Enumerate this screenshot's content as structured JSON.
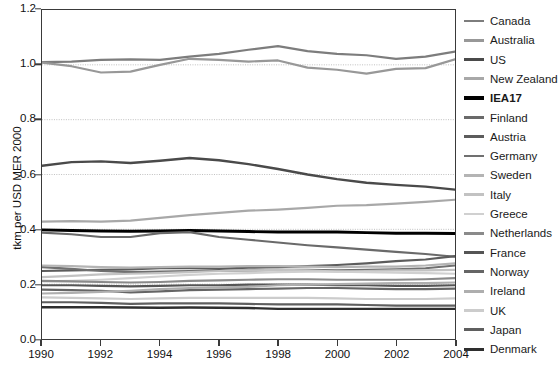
{
  "chart_data": {
    "type": "line",
    "title": "",
    "xlabel": "",
    "ylabel": "tkm per USD MER 2000",
    "xlim": [
      1990,
      2004
    ],
    "ylim": [
      0.0,
      1.2
    ],
    "x": [
      1990,
      1991,
      1992,
      1993,
      1994,
      1995,
      1996,
      1997,
      1998,
      1999,
      2000,
      2001,
      2002,
      2003,
      2004
    ],
    "ytick_labels": [
      "0.0",
      "0.2",
      "0.4",
      "0.6",
      "0.8",
      "1.0",
      "1.2"
    ],
    "ytick_values": [
      0.0,
      0.2,
      0.4,
      0.6,
      0.8,
      1.0,
      1.2
    ],
    "xtick_labels": [
      "1990",
      "1992",
      "1994",
      "1996",
      "1998",
      "2000",
      "2002",
      "2004"
    ],
    "xtick_values": [
      1990,
      1992,
      1994,
      1996,
      1998,
      2000,
      2002,
      2004
    ],
    "grid": "horizontal-dotted",
    "gridlines": [
      0.2,
      0.4,
      0.6,
      0.8,
      1.0
    ],
    "legend_position": "right",
    "series": [
      {
        "name": "Canada",
        "color": "#7d7d7d",
        "width": 2.2,
        "values": [
          1.01,
          1.012,
          1.018,
          1.02,
          1.018,
          1.03,
          1.04,
          1.055,
          1.068,
          1.05,
          1.04,
          1.035,
          1.022,
          1.03,
          1.048
        ]
      },
      {
        "name": "Australia",
        "color": "#989898",
        "width": 2.2,
        "values": [
          1.008,
          0.995,
          0.972,
          0.975,
          1.0,
          1.022,
          1.018,
          1.012,
          1.016,
          0.99,
          0.982,
          0.968,
          0.985,
          0.988,
          1.02
        ]
      },
      {
        "name": "US",
        "color": "#4a4a4a",
        "width": 2.4,
        "values": [
          0.632,
          0.645,
          0.648,
          0.642,
          0.65,
          0.66,
          0.652,
          0.638,
          0.62,
          0.6,
          0.583,
          0.57,
          0.562,
          0.556,
          0.545
        ]
      },
      {
        "name": "New Zealand",
        "color": "#a8a8a8",
        "width": 2.2,
        "values": [
          0.428,
          0.43,
          0.428,
          0.432,
          0.442,
          0.452,
          0.46,
          0.468,
          0.472,
          0.478,
          0.486,
          0.488,
          0.494,
          0.5,
          0.508
        ]
      },
      {
        "name": "IEA17",
        "color": "#000000",
        "width": 3.0,
        "values": [
          0.398,
          0.396,
          0.394,
          0.393,
          0.394,
          0.396,
          0.394,
          0.392,
          0.39,
          0.39,
          0.39,
          0.388,
          0.386,
          0.386,
          0.385
        ]
      },
      {
        "name": "Finland",
        "color": "#6a6a6a",
        "width": 2.2,
        "values": [
          0.388,
          0.382,
          0.372,
          0.372,
          0.386,
          0.39,
          0.372,
          0.362,
          0.352,
          0.342,
          0.334,
          0.326,
          0.318,
          0.31,
          0.3
        ]
      },
      {
        "name": "Austria",
        "color": "#5c5c5c",
        "width": 2.2,
        "values": [
          0.248,
          0.25,
          0.252,
          0.254,
          0.258,
          0.258,
          0.256,
          0.26,
          0.262,
          0.266,
          0.27,
          0.276,
          0.284,
          0.29,
          0.302
        ]
      },
      {
        "name": "Germany",
        "color": "#707070",
        "width": 2.2,
        "values": [
          0.262,
          0.256,
          0.248,
          0.244,
          0.246,
          0.248,
          0.248,
          0.25,
          0.252,
          0.252,
          0.25,
          0.252,
          0.254,
          0.258,
          0.268
        ]
      },
      {
        "name": "Sweden",
        "color": "#b4b4b4",
        "width": 2.2,
        "values": [
          0.268,
          0.266,
          0.262,
          0.26,
          0.262,
          0.264,
          0.264,
          0.266,
          0.266,
          0.264,
          0.262,
          0.264,
          0.264,
          0.268,
          0.276
        ]
      },
      {
        "name": "Italy",
        "color": "#c2c2c2",
        "width": 2.2,
        "values": [
          0.226,
          0.23,
          0.236,
          0.238,
          0.24,
          0.244,
          0.248,
          0.25,
          0.252,
          0.25,
          0.246,
          0.248,
          0.25,
          0.25,
          0.252
        ]
      },
      {
        "name": "Greece",
        "color": "#d0d0d0",
        "width": 2.2,
        "values": [
          0.21,
          0.212,
          0.216,
          0.222,
          0.228,
          0.234,
          0.238,
          0.24,
          0.244,
          0.246,
          0.246,
          0.244,
          0.242,
          0.24,
          0.238
        ]
      },
      {
        "name": "Netherlands",
        "color": "#8a8a8a",
        "width": 2.2,
        "values": [
          0.212,
          0.21,
          0.208,
          0.206,
          0.208,
          0.212,
          0.214,
          0.216,
          0.218,
          0.218,
          0.216,
          0.216,
          0.216,
          0.218,
          0.222
        ]
      },
      {
        "name": "France",
        "color": "#555555",
        "width": 2.2,
        "values": [
          0.196,
          0.196,
          0.194,
          0.192,
          0.194,
          0.196,
          0.196,
          0.198,
          0.198,
          0.198,
          0.196,
          0.196,
          0.194,
          0.194,
          0.196
        ]
      },
      {
        "name": "Norway",
        "color": "#656565",
        "width": 2.2,
        "values": [
          0.18,
          0.178,
          0.176,
          0.17,
          0.174,
          0.178,
          0.18,
          0.182,
          0.184,
          0.186,
          0.186,
          0.184,
          0.182,
          0.182,
          0.184
        ]
      },
      {
        "name": "Ireland",
        "color": "#aeaeae",
        "width": 2.2,
        "values": [
          0.166,
          0.168,
          0.172,
          0.176,
          0.182,
          0.186,
          0.188,
          0.19,
          0.196,
          0.198,
          0.2,
          0.202,
          0.204,
          0.204,
          0.206
        ]
      },
      {
        "name": "UK",
        "color": "#cccccc",
        "width": 2.2,
        "values": [
          0.152,
          0.15,
          0.148,
          0.146,
          0.148,
          0.15,
          0.15,
          0.15,
          0.15,
          0.15,
          0.148,
          0.146,
          0.146,
          0.146,
          0.148
        ]
      },
      {
        "name": "Japan",
        "color": "#5f5f5f",
        "width": 2.2,
        "values": [
          0.134,
          0.134,
          0.132,
          0.128,
          0.13,
          0.13,
          0.13,
          0.128,
          0.126,
          0.126,
          0.126,
          0.124,
          0.122,
          0.122,
          0.122
        ]
      },
      {
        "name": "Denmark",
        "color": "#2e2e2e",
        "width": 2.4,
        "values": [
          0.116,
          0.116,
          0.116,
          0.115,
          0.114,
          0.115,
          0.114,
          0.113,
          0.11,
          0.11,
          0.11,
          0.11,
          0.11,
          0.11,
          0.11
        ]
      }
    ]
  },
  "legend": {
    "items": [
      {
        "label": "Canada",
        "bold": false
      },
      {
        "label": "Australia",
        "bold": false
      },
      {
        "label": "US",
        "bold": false
      },
      {
        "label": "New Zealand",
        "bold": false
      },
      {
        "label": "IEA17",
        "bold": true
      },
      {
        "label": "Finland",
        "bold": false
      },
      {
        "label": "Austria",
        "bold": false
      },
      {
        "label": "Germany",
        "bold": false
      },
      {
        "label": "Sweden",
        "bold": false
      },
      {
        "label": "Italy",
        "bold": false
      },
      {
        "label": "Greece",
        "bold": false
      },
      {
        "label": "Netherlands",
        "bold": false
      },
      {
        "label": "France",
        "bold": false
      },
      {
        "label": "Norway",
        "bold": false
      },
      {
        "label": "Ireland",
        "bold": false
      },
      {
        "label": "UK",
        "bold": false
      },
      {
        "label": "Japan",
        "bold": false
      },
      {
        "label": "Denmark",
        "bold": false
      }
    ]
  },
  "style": {
    "axis_color": "#3a3a3a",
    "grid_color": "#b9b9b9",
    "background": "#ffffff"
  }
}
